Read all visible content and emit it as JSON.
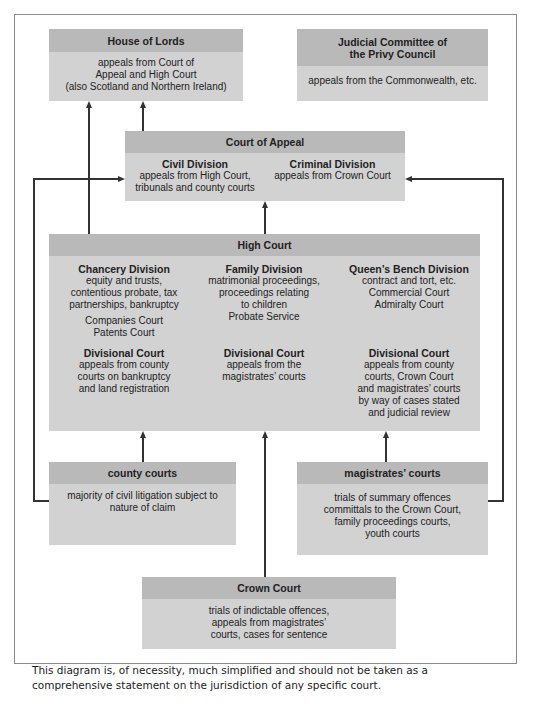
{
  "house_of_lords": {
    "title": "House of Lords",
    "body": "appeals from Court of\nAppeal and High Court\n(also Scotland and Northern Ireland)"
  },
  "privy_council": {
    "title": "Judicial Committee of\nthe Privy Council",
    "body": "appeals from the Commonwealth, etc."
  },
  "court_of_appeal": {
    "title": "Court of Appeal",
    "civil": {
      "title": "Civil Division",
      "body": "appeals from High Court,\ntribunals and county courts"
    },
    "criminal": {
      "title": "Criminal Division",
      "body": "appeals from Crown Court"
    }
  },
  "high_court": {
    "title": "High Court",
    "chancery": {
      "title": "Chancery Division",
      "body": "equity and trusts,\ncontentious probate, tax\npartnerships, bankruptcy",
      "extra": "Companies Court\nPatents Court"
    },
    "family": {
      "title": "Family Division",
      "body": "matrimonial proceedings,\nproceedings relating\nto children\nProbate Service"
    },
    "queens_bench": {
      "title": "Queen’s Bench Division",
      "body": "contract and tort, etc.\nCommercial Court\nAdmiralty Court"
    },
    "divisional_1": {
      "title": "Divisional Court",
      "body": "appeals from county\ncourts on bankruptcy\nand land registration"
    },
    "divisional_2": {
      "title": "Divisional Court",
      "body": "appeals from the\nmagistrates’ courts"
    },
    "divisional_3": {
      "title": "Divisional Court",
      "body": "appeals from county\ncourts, Crown Court\nand magistrates’ courts\nby way of cases stated\nand judicial review"
    }
  },
  "county_courts": {
    "title": "county courts",
    "body": "majority of civil litigation subject to\nnature of claim"
  },
  "magistrates_courts": {
    "title": "magistrates’ courts",
    "body": "trials of summary offences\ncommittals to the Crown Court,\nfamily proceedings courts,\nyouth courts"
  },
  "crown_court": {
    "title": "Crown Court",
    "body": "trials of indictable offences,\nappeals from magistrates’\ncourts, cases for sentence"
  },
  "note": "This diagram is, of necessity, much simplified and should not be taken as a comprehensive statement on the jurisdiction of any specific court."
}
